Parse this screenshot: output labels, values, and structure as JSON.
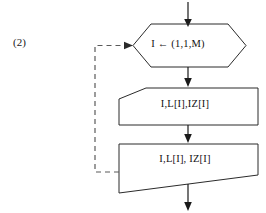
{
  "figure": {
    "label": "(2)",
    "type": "flowchart"
  },
  "nodes": {
    "loop_control": {
      "shape": "hexagon",
      "text": "I ← (1,1,M)",
      "role": "loop-control"
    },
    "input": {
      "shape": "input-parallelogram",
      "text": "I,L[I],IZ[I]",
      "role": "input"
    },
    "output": {
      "shape": "output-slanted-bottom",
      "text": "I,L[I], IZ[I]",
      "role": "output"
    }
  },
  "connectors": {
    "entry_arrow": "arrow-down-into-loop-control",
    "loop_to_input": "arrow-down",
    "input_to_output": "arrow-down",
    "exit_arrow": "arrow-down-out",
    "feedback": "dashed-loop-back-to-loop-control"
  },
  "colors": {
    "stroke": "#2b2b2b",
    "connector": "#1a1a1a",
    "dashed": "#5a5a5a",
    "text": "#111111",
    "background": "#ffffff"
  }
}
